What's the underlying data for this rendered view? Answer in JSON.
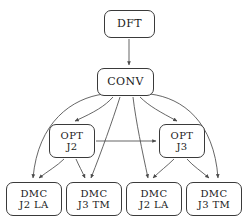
{
  "diagram": {
    "type": "flowchart-tree",
    "orientation": "top-down",
    "style": {
      "node_shape": "rounded-rectangle",
      "node_fill": "#ffffff",
      "node_border": "#3a3a3a",
      "edge_color": "#4a4a4a",
      "background": "#ffffff",
      "arrowheads": true
    },
    "nodes": [
      {
        "id": "dft",
        "line1": "DFT",
        "line2": "",
        "level": 0
      },
      {
        "id": "conv",
        "line1": "CONV",
        "line2": "",
        "level": 1
      },
      {
        "id": "opt_j2",
        "line1": "OPT",
        "line2": "J2",
        "level": 2
      },
      {
        "id": "opt_j3",
        "line1": "OPT",
        "line2": "J3",
        "level": 2
      },
      {
        "id": "dmc1",
        "line1": "DMC",
        "line2": "J2 LA",
        "level": 3
      },
      {
        "id": "dmc2",
        "line1": "DMC",
        "line2": "J3 TM",
        "level": 3
      },
      {
        "id": "dmc3",
        "line1": "DMC",
        "line2": "J2 LA",
        "level": 3
      },
      {
        "id": "dmc4",
        "line1": "DMC",
        "line2": "J3 TM",
        "level": 3
      }
    ],
    "edges": [
      {
        "from": "dft",
        "to": "conv"
      },
      {
        "from": "conv",
        "to": "opt_j2"
      },
      {
        "from": "conv",
        "to": "opt_j3"
      },
      {
        "from": "conv",
        "to": "dmc1"
      },
      {
        "from": "conv",
        "to": "dmc2"
      },
      {
        "from": "conv",
        "to": "dmc3"
      },
      {
        "from": "conv",
        "to": "dmc4"
      },
      {
        "from": "opt_j2",
        "to": "opt_j3"
      },
      {
        "from": "opt_j2",
        "to": "dmc1"
      },
      {
        "from": "opt_j2",
        "to": "dmc2"
      },
      {
        "from": "opt_j3",
        "to": "dmc3"
      },
      {
        "from": "opt_j3",
        "to": "dmc4"
      }
    ]
  }
}
